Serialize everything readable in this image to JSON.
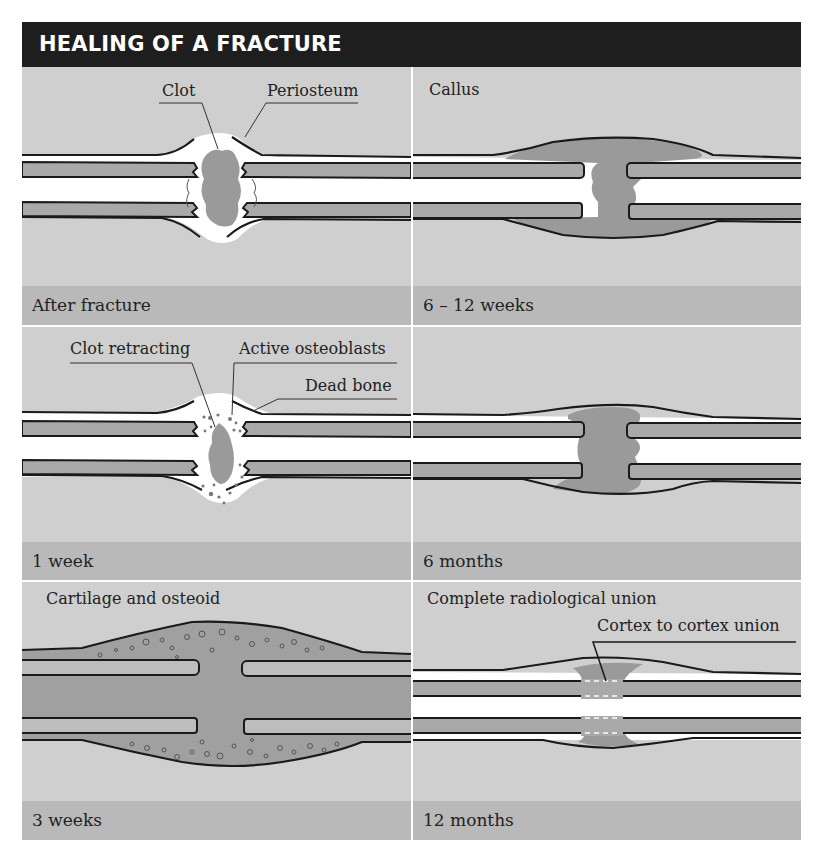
{
  "title": "HEALING OF A FRACTURE",
  "colors": {
    "title_bg": "#1e1e1e",
    "panel_bg": "#cfcfcf",
    "caption_bg": "#b9b9b9",
    "bone": "#a9a9a9",
    "clot": "#9a9a9a",
    "outline": "#1a1a1a",
    "marrow": "#ffffff"
  },
  "panels": [
    {
      "id": "after-fracture",
      "heading": "",
      "caption": "After fracture",
      "callouts": [
        {
          "label": "Clot"
        },
        {
          "label": "Periosteum"
        }
      ]
    },
    {
      "id": "6-12-weeks",
      "heading": "Callus",
      "caption": "6 – 12 weeks",
      "callouts": []
    },
    {
      "id": "1-week",
      "heading": "",
      "caption": "1 week",
      "callouts": [
        {
          "label": "Clot retracting"
        },
        {
          "label": "Active osteoblasts"
        },
        {
          "label": "Dead bone"
        }
      ]
    },
    {
      "id": "6-months",
      "heading": "",
      "caption": "6 months",
      "callouts": []
    },
    {
      "id": "3-weeks",
      "heading": "Cartilage and osteoid",
      "caption": "3 weeks",
      "callouts": []
    },
    {
      "id": "12-months",
      "heading": "Complete radiological union",
      "caption": "12 months",
      "callouts": [
        {
          "label": "Cortex to cortex union"
        }
      ]
    }
  ]
}
